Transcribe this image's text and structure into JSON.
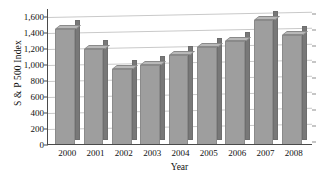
{
  "chart_data": {
    "type": "bar",
    "title": "",
    "xlabel": "Year",
    "ylabel": "S & P 500 Index",
    "categories": [
      "2000",
      "2001",
      "2002",
      "2003",
      "2004",
      "2005",
      "2006",
      "2007",
      "2008"
    ],
    "values": [
      1450,
      1200,
      950,
      1000,
      1120,
      1230,
      1300,
      1560,
      1370
    ],
    "ylim": [
      0,
      1700
    ],
    "ytick_values": [
      0,
      200,
      400,
      600,
      800,
      1000,
      1200,
      1400,
      1600
    ],
    "ytick_labels": [
      "0",
      "200",
      "400",
      "600",
      "800",
      "1,000",
      "1,200",
      "1,400",
      "1,600"
    ],
    "grid": true,
    "legend": "none",
    "style": "3d-column",
    "bar_face_color": "#9e9e9e",
    "bar_side_color": "#787878",
    "bar_top_color": "#b8b8b8",
    "gridline_color": "#c9c9c9",
    "axis_color": "#4a4a4a",
    "background_color": "#ffffff"
  }
}
